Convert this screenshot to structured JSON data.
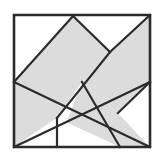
{
  "figure": {
    "canvas": {
      "width": 162,
      "height": 159
    },
    "background_color": "#ffffff"
  },
  "square_frame": {
    "name": "outer square",
    "top_left": [
      14,
      15
    ],
    "top_right": [
      150,
      15
    ],
    "bottom_right": [
      150,
      147
    ],
    "bottom_left": [
      14,
      147
    ],
    "stroke_color": "#2b2b2b",
    "stroke_width": 2.6,
    "fill_color": "#ffffff"
  },
  "palette": {
    "shaded_fill": "#dcdcdc",
    "empty_fill": "#ffffff",
    "line_color": "#2b2b2b",
    "frame_color": "#3a3a3a"
  },
  "key_points": {
    "center_crossing": [
      82,
      82
    ],
    "left_edge_mid": [
      14,
      82
    ],
    "right_edge_mid": [
      150,
      82
    ],
    "top_edge_notch": [
      73,
      16
    ],
    "bottom_edge_left_notch": [
      57,
      147
    ],
    "bottom_edge_right_notch": [
      120,
      147
    ],
    "upper_right_apex": [
      110,
      52
    ],
    "lower_left_apex": [
      57,
      118
    ],
    "lower_right_apex": [
      118,
      113
    ]
  },
  "pieces": [
    {
      "id": "piece-upper-left-band",
      "label": "upper left shaded band",
      "fill": "#dcdcdc",
      "points": "14,15 73,16 110,52 82,82 14,82"
    },
    {
      "id": "piece-upper-right-band",
      "label": "upper right shaded band",
      "fill": "#dcdcdc",
      "points": "150,15 150,82 118,113 82,82 110,52"
    },
    {
      "id": "piece-lower-left-band",
      "label": "lower left shaded band",
      "fill": "#dcdcdc",
      "points": "14,82 82,82 57,118 14,147"
    },
    {
      "id": "piece-lower-right-band",
      "label": "lower right shaded band",
      "fill": "#dcdcdc",
      "points": "82,82 118,113 150,147 120,147 57,147"
    }
  ],
  "voids": [
    {
      "id": "void-top-left-triangle",
      "label": "top left white triangle",
      "fill": "#ffffff",
      "points": "14,15 14,82 73,16"
    },
    {
      "id": "void-top-right-triangle",
      "label": "top right white triangle",
      "fill": "#ffffff",
      "points": "73,16 150,15 110,52"
    },
    {
      "id": "void-bottom-left-triangle",
      "label": "bottom left white triangle",
      "fill": "#ffffff",
      "points": "14,147 57,118 57,147"
    },
    {
      "id": "void-bottom-center-triangle",
      "label": "bottom center white triangle",
      "fill": "#ffffff",
      "points": "57,118 120,147 57,147"
    },
    {
      "id": "void-bottom-right-triangle",
      "label": "bottom right white triangle",
      "fill": "#ffffff",
      "points": "118,113 150,82 150,147"
    }
  ],
  "cut_lines": [
    {
      "id": "cut-tl-diagonal",
      "label": "top left diagonal",
      "from": [
        14,
        82
      ],
      "to": [
        73,
        16
      ]
    },
    {
      "id": "cut-top-notch-down",
      "label": "top notch to upper right apex",
      "from": [
        73,
        16
      ],
      "to": [
        110,
        52
      ]
    },
    {
      "id": "cut-tr-diagonal",
      "label": "top right diagonal",
      "from": [
        110,
        52
      ],
      "to": [
        150,
        15
      ]
    },
    {
      "id": "cut-main-nw-se",
      "label": "main diagonal northwest to southeast",
      "from": [
        14,
        82
      ],
      "to": [
        150,
        147
      ]
    },
    {
      "id": "cut-main-ne-sw",
      "label": "main diagonal northeast to southwest",
      "from": [
        150,
        82
      ],
      "to": [
        14,
        147
      ]
    },
    {
      "id": "cut-upper-apex-center",
      "label": "upper right apex through center",
      "from": [
        110,
        52
      ],
      "to": [
        57,
        118
      ]
    },
    {
      "id": "cut-center-lower-right",
      "label": "center to lower right notch",
      "from": [
        82,
        82
      ],
      "to": [
        120,
        147
      ]
    },
    {
      "id": "cut-lower-left-apex-bottom",
      "label": "lower left apex to bottom edge",
      "from": [
        57,
        118
      ],
      "to": [
        57,
        147
      ]
    },
    {
      "id": "cut-lower-right-apex-edge",
      "label": "lower right apex to right edge",
      "from": [
        118,
        113
      ],
      "to": [
        150,
        82
      ]
    }
  ]
}
